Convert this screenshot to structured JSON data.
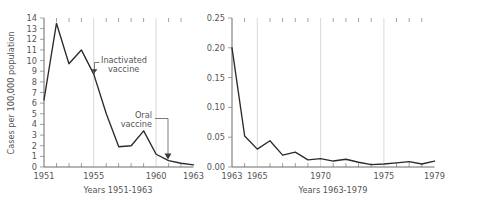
{
  "chart_data": [
    {
      "id": "left-panel",
      "type": "line",
      "title": "",
      "xlabel": "Years 1951-1963",
      "ylabel": "Cases per 100,000 population",
      "xlim": [
        1951,
        1963
      ],
      "ylim": [
        0,
        14
      ],
      "grid": "vertical-major",
      "legend": "none",
      "ytick_labels": [
        "0",
        "1",
        "2",
        "3",
        "4",
        "5",
        "6",
        "7",
        "8",
        "9",
        "10",
        "11",
        "12",
        "13",
        "14"
      ],
      "ytick_values": [
        0,
        1,
        2,
        3,
        4,
        5,
        6,
        7,
        8,
        9,
        10,
        11,
        12,
        13,
        14
      ],
      "xtick_labels": [
        "1951",
        "1955",
        "1960",
        "1963"
      ],
      "xtick_values": [
        1951,
        1955,
        1960,
        1963
      ],
      "xminor_values": [
        1952,
        1953,
        1954,
        1956,
        1957,
        1958,
        1959,
        1961,
        1962
      ],
      "x": [
        1951,
        1952,
        1953,
        1954,
        1955,
        1956,
        1957,
        1958,
        1959,
        1960,
        1961,
        1962,
        1963
      ],
      "values": [
        6.3,
        13.5,
        9.7,
        11.0,
        8.7,
        5.0,
        1.9,
        2.0,
        3.4,
        1.2,
        0.6,
        0.35,
        0.2
      ],
      "annotations": [
        {
          "label_line1": "Inactivated",
          "label_line2": "vaccine",
          "target_x": 1955.4,
          "target_y": 8.9
        },
        {
          "label_line1": "Oral",
          "label_line2": "vaccine",
          "target_x": 1961.0,
          "target_y": 0.65
        }
      ]
    },
    {
      "id": "right-panel",
      "type": "line",
      "title": "",
      "xlabel": "Years 1963-1979",
      "ylabel": "",
      "xlim": [
        1963,
        1979
      ],
      "ylim": [
        0.0,
        0.25
      ],
      "grid": "vertical-major",
      "legend": "none",
      "ytick_labels": [
        "0.00",
        "0.05",
        "0.10",
        "0.15",
        "0.20",
        "0.25"
      ],
      "ytick_values": [
        0.0,
        0.05,
        0.1,
        0.15,
        0.2,
        0.25
      ],
      "xtick_labels": [
        "1963",
        "1965",
        "1970",
        "1975",
        "1979"
      ],
      "xtick_values": [
        1963,
        1965,
        1970,
        1975,
        1979
      ],
      "xminor_values": [
        1964,
        1966,
        1967,
        1968,
        1969,
        1971,
        1972,
        1973,
        1974,
        1976,
        1977,
        1978
      ],
      "x": [
        1963,
        1964,
        1965,
        1966,
        1967,
        1968,
        1969,
        1970,
        1971,
        1972,
        1973,
        1974,
        1975,
        1976,
        1977,
        1978,
        1979
      ],
      "values": [
        0.2,
        0.052,
        0.03,
        0.044,
        0.02,
        0.025,
        0.012,
        0.014,
        0.01,
        0.013,
        0.008,
        0.004,
        0.005,
        0.007,
        0.009,
        0.005,
        0.01
      ]
    }
  ]
}
